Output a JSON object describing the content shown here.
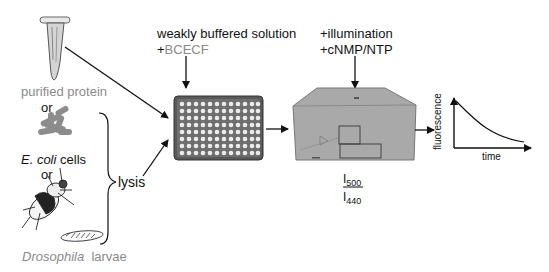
{
  "sources": {
    "protein_label": "purified protein",
    "or1": "or",
    "ecoli_italic": "E. coli",
    "ecoli_rest": " cells",
    "or2": "or",
    "drosophila_italic": "Drosophila",
    "drosophila_rest": "  larvae",
    "lysis_label": "lysis"
  },
  "step1": {
    "line1": "weakly buffered solution",
    "plus": "+",
    "dye": "BCECF"
  },
  "step2": {
    "line1": "+illumination",
    "line2": "+cNMP/NTP"
  },
  "ratio": {
    "numerator": "I",
    "numerator_sub": "500",
    "denominator": "I",
    "denominator_sub": "440"
  },
  "plot": {
    "ylabel": "fluorescence",
    "xlabel": "time"
  },
  "colors": {
    "text": "#111111",
    "gray_text": "#8a8a8a",
    "instrument": "#a8a8a8",
    "ecoli": "#8c8c8c"
  }
}
